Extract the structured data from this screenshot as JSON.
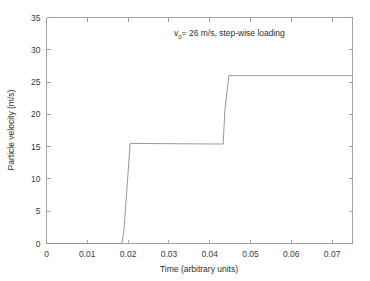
{
  "chart_data": {
    "type": "line",
    "title": "",
    "xlabel": "Time (arbitrary units)",
    "ylabel": "Particle velocity (m/s)",
    "xlim": [
      0,
      0.075
    ],
    "ylim": [
      0,
      35
    ],
    "grid": false,
    "legend": "none",
    "line_color": "#8d8d8d",
    "axis_color": "#9a9a9a",
    "background": "#ffffff",
    "xticks": [
      0,
      0.01,
      0.02,
      0.03,
      0.04,
      0.05,
      0.06,
      0.07
    ],
    "xtick_labels": [
      "0",
      "0.01",
      "0.02",
      "0.03",
      "0.04",
      "0.05",
      "0.06",
      "0.07"
    ],
    "yticks": [
      0,
      5,
      10,
      15,
      20,
      25,
      30,
      35
    ],
    "ytick_labels": [
      "0",
      "5",
      "10",
      "15",
      "20",
      "25",
      "30",
      "35"
    ],
    "annotations": [
      {
        "name": "initial-velocity-note",
        "text_prefix": "v",
        "text_subscript": "0",
        "text_suffix": "= 26 m/s, step-wise loading",
        "x": 0.0335,
        "y": 31.3
      }
    ],
    "series": [
      {
        "name": "particle velocity",
        "x": [
          0.0,
          0.0185,
          0.019,
          0.0205,
          0.0433,
          0.0437,
          0.0447,
          0.075
        ],
        "y": [
          0.0,
          0.0,
          2.2,
          15.5,
          15.4,
          20.5,
          26.0,
          26.0
        ]
      }
    ],
    "steps": [
      {
        "label": "baseline",
        "start": 0.0,
        "end": 0.0185,
        "value": 0.0
      },
      {
        "label": "first plateau",
        "start": 0.0205,
        "end": 0.0433,
        "value": 15.5
      },
      {
        "label": "second plateau",
        "start": 0.0447,
        "end": 0.075,
        "value": 26.0
      }
    ]
  }
}
